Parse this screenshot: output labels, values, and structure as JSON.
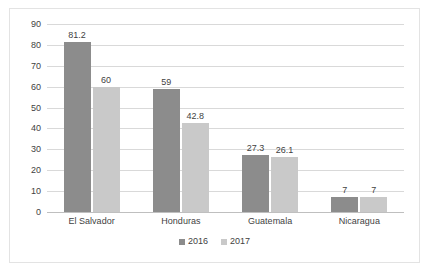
{
  "chart_data": {
    "type": "bar",
    "title": "",
    "subtitle": "",
    "xlabel": "",
    "ylabel": "",
    "categories": [
      "El Salvador",
      "Honduras",
      "Guatemala",
      "Nicaragua"
    ],
    "series": [
      {
        "name": "2016",
        "color": "#8c8c8c",
        "values": [
          81.2,
          59,
          27.3,
          7
        ],
        "labels": [
          "81.2",
          "59",
          "27.3",
          "7"
        ]
      },
      {
        "name": "2017",
        "color": "#c9c9c9",
        "values": [
          60,
          42.8,
          26.1,
          7
        ],
        "labels": [
          "60",
          "42.8",
          "26.1",
          "7"
        ]
      }
    ],
    "ylim": [
      0,
      90
    ],
    "ytick_step": 10,
    "ytick_labels": [
      "90",
      "80",
      "70",
      "60",
      "50",
      "40",
      "30",
      "20",
      "10",
      "0"
    ],
    "ytick_values": [
      90,
      80,
      70,
      60,
      50,
      40,
      30,
      20,
      10,
      0
    ],
    "grid": true,
    "grid_color": "#d9d9d9",
    "legend_position": "bottom-center",
    "data_labels_shown": true,
    "background_color": "#ffffff",
    "border_color": "#e3e3e3",
    "text_color": "#3f3f3f"
  },
  "legend": {
    "items": [
      {
        "label": "2016",
        "color": "#8c8c8c"
      },
      {
        "label": "2017",
        "color": "#c9c9c9"
      }
    ]
  }
}
